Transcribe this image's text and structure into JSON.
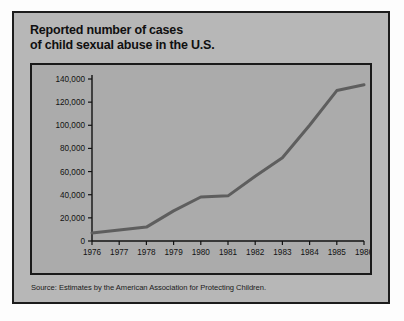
{
  "title": {
    "line1": "Reported number of cases",
    "line2": "of child sexual abuse in the U.S."
  },
  "source": "Source: Estimates by the American Association for Protecting Children.",
  "colors": {
    "page_background": "#fdfdfd",
    "card_background": "#b7b7b7",
    "panel_background": "#ababab",
    "border": "#1a1a1a",
    "line": "#5e5e5e",
    "text": "#121212"
  },
  "chart_data": {
    "type": "line",
    "title": "Reported number of cases of child sexual abuse in the U.S.",
    "xlabel": "",
    "ylabel": "",
    "x": [
      1976,
      1977,
      1978,
      1979,
      1980,
      1981,
      1982,
      1983,
      1984,
      1985,
      1986
    ],
    "categories": [
      "1976",
      "1977",
      "1978",
      "1979",
      "1980",
      "1981",
      "1982",
      "1983",
      "1984",
      "1985",
      "1986"
    ],
    "values": [
      7000,
      9500,
      12000,
      26000,
      38000,
      39000,
      56000,
      72000,
      100000,
      130000,
      135000
    ],
    "series": [
      {
        "name": "Reported cases",
        "values": [
          7000,
          9500,
          12000,
          26000,
          38000,
          39000,
          56000,
          72000,
          100000,
          130000,
          135000
        ]
      }
    ],
    "xlim": [
      1976,
      1986
    ],
    "ylim": [
      0,
      140000
    ],
    "ytick_values": [
      0,
      20000,
      40000,
      60000,
      80000,
      100000,
      120000,
      140000
    ],
    "ytick_labels": [
      "0",
      "20,000",
      "40,000",
      "60,000",
      "80,000",
      "100,000",
      "120,000",
      "140,000"
    ],
    "xtick_labels": [
      "1976",
      "1977",
      "1978",
      "1979",
      "1980",
      "1981",
      "1982",
      "1983",
      "1984",
      "1985",
      "1986"
    ],
    "grid": false,
    "legend": false
  }
}
